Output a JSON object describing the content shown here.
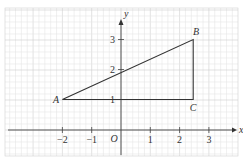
{
  "figure": {
    "label": "",
    "grid": {
      "minor_per_unit": 5,
      "color_minor": "#e6e6e6",
      "color_major": "#cfcfcf"
    },
    "axes": {
      "x_label": "x",
      "y_label": "y",
      "origin_label": "O",
      "x_ticks": [
        "-2",
        "-1",
        "1",
        "2",
        "3"
      ],
      "y_ticks": [
        "1",
        "2",
        "3"
      ]
    },
    "points": {
      "A": {
        "label": "A",
        "x": -2,
        "y": 1
      },
      "B": {
        "label": "B",
        "x": 2.5,
        "y": 3
      },
      "C": {
        "label": "C",
        "x": 2.5,
        "y": 1
      }
    },
    "segments": [
      "AB",
      "BC",
      "CA"
    ],
    "line_color": "#333333"
  },
  "chart_data": {
    "type": "diagram",
    "title": "",
    "xlabel": "x",
    "ylabel": "y",
    "xlim": [
      -4,
      4
    ],
    "ylim": [
      -1,
      4
    ],
    "grid": true,
    "points": [
      {
        "name": "A",
        "x": -2,
        "y": 1
      },
      {
        "name": "B",
        "x": 2.5,
        "y": 3
      },
      {
        "name": "C",
        "x": 2.5,
        "y": 1
      }
    ],
    "polygon": [
      "A",
      "B",
      "C"
    ],
    "x_tick_labels": [
      "-2",
      "-1",
      "1",
      "2",
      "3"
    ],
    "y_tick_labels": [
      "1",
      "2",
      "3"
    ],
    "origin_label": "O"
  }
}
